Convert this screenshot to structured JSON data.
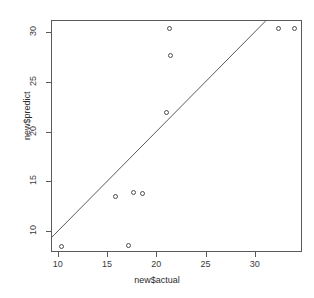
{
  "chart_data": {
    "type": "scatter",
    "title": "",
    "xlabel": "new$actual",
    "ylabel": "new$predict",
    "xlim": [
      9.3,
      34.8
    ],
    "ylim": [
      7.9,
      31.2
    ],
    "xticks": [
      10,
      15,
      20,
      25,
      30
    ],
    "yticks": [
      10,
      15,
      20,
      25,
      30
    ],
    "grid": false,
    "legend": null,
    "points": [
      {
        "x": 10.4,
        "y": 8.5
      },
      {
        "x": 15.9,
        "y": 13.5
      },
      {
        "x": 17.2,
        "y": 8.6
      },
      {
        "x": 17.7,
        "y": 13.9
      },
      {
        "x": 18.6,
        "y": 13.8
      },
      {
        "x": 21.0,
        "y": 21.9
      },
      {
        "x": 21.4,
        "y": 27.6
      },
      {
        "x": 21.3,
        "y": 30.3
      },
      {
        "x": 32.4,
        "y": 30.3
      },
      {
        "x": 34.0,
        "y": 30.3
      }
    ],
    "reference_line": {
      "type": "abline",
      "intercept": 0,
      "slope": 1,
      "description": "identity line y = x"
    },
    "marker": {
      "symbol": "open-circle",
      "color": "#4d4d4d",
      "size": 5
    },
    "line_color": "#5a5a5a",
    "axis_color": "#5a5a5a",
    "background": "#ffffff"
  }
}
